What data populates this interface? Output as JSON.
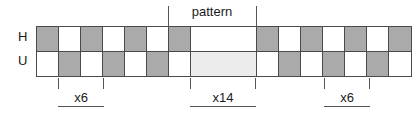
{
  "figure": {
    "pattern_label": "pattern",
    "rows": [
      {
        "name": "H",
        "label": "H",
        "cells": [
          {
            "fill": "gray",
            "width": 1
          },
          {
            "fill": "white",
            "width": 1
          },
          {
            "fill": "gray",
            "width": 1
          },
          {
            "fill": "white",
            "width": 1
          },
          {
            "fill": "gray",
            "width": 1
          },
          {
            "fill": "white",
            "width": 1
          },
          {
            "fill": "gray",
            "width": 1
          },
          {
            "fill": "white",
            "width": 3
          },
          {
            "fill": "gray",
            "width": 1
          },
          {
            "fill": "white",
            "width": 1
          },
          {
            "fill": "gray",
            "width": 1
          },
          {
            "fill": "white",
            "width": 1
          },
          {
            "fill": "gray",
            "width": 1
          },
          {
            "fill": "white",
            "width": 1
          },
          {
            "fill": "gray",
            "width": 1
          }
        ]
      },
      {
        "name": "U",
        "label": "U",
        "cells": [
          {
            "fill": "white",
            "width": 1
          },
          {
            "fill": "gray",
            "width": 1
          },
          {
            "fill": "white",
            "width": 1
          },
          {
            "fill": "gray",
            "width": 1
          },
          {
            "fill": "white",
            "width": 1
          },
          {
            "fill": "gray",
            "width": 1
          },
          {
            "fill": "white",
            "width": 1
          },
          {
            "fill": "light",
            "width": 3
          },
          {
            "fill": "white",
            "width": 1
          },
          {
            "fill": "gray",
            "width": 1
          },
          {
            "fill": "white",
            "width": 1
          },
          {
            "fill": "gray",
            "width": 1
          },
          {
            "fill": "white",
            "width": 1
          },
          {
            "fill": "gray",
            "width": 1
          },
          {
            "fill": "white",
            "width": 1
          }
        ]
      }
    ],
    "brackets": [
      {
        "name": "left",
        "label": "x6"
      },
      {
        "name": "center",
        "label": "x14"
      },
      {
        "name": "right",
        "label": "x6"
      }
    ],
    "colors": {
      "cell_gray": "#aaaaaa",
      "cell_white": "#ffffff",
      "cell_light": "#ececec",
      "stroke": "#4a4a4a",
      "guide": "#555555",
      "text": "#1a1a1a",
      "background": "#ffffff"
    }
  }
}
